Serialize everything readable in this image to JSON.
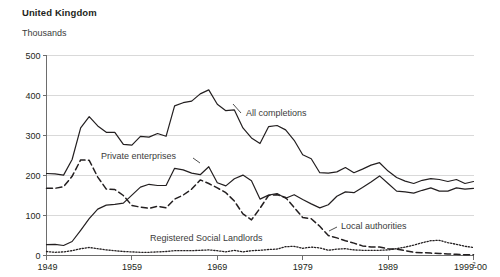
{
  "header": {
    "title": "United Kingdom",
    "unit_label": "Thousands"
  },
  "chart_data": {
    "type": "line",
    "title": "United Kingdom",
    "subtitle": "Thousands",
    "xlabel": "",
    "ylabel": "Thousands",
    "ylim": [
      0,
      500
    ],
    "yticks": [
      0,
      100,
      200,
      300,
      400,
      500
    ],
    "ytick_labels": [
      "0",
      "100",
      "200",
      "300",
      "400",
      "500"
    ],
    "xlim": [
      1949,
      1999
    ],
    "xticks": [
      1949,
      1959,
      1969,
      1979,
      1989,
      1999
    ],
    "xtick_labels": [
      "1949",
      "1959",
      "1969",
      "1979",
      "1989",
      "1999-00"
    ],
    "xtick_last_superscript": "2",
    "grid": "horizontal",
    "legend_position": "inline-annotations",
    "x": [
      1949,
      1950,
      1951,
      1952,
      1953,
      1954,
      1955,
      1956,
      1957,
      1958,
      1959,
      1960,
      1961,
      1962,
      1963,
      1964,
      1965,
      1966,
      1967,
      1968,
      1969,
      1970,
      1971,
      1972,
      1973,
      1974,
      1975,
      1976,
      1977,
      1978,
      1979,
      1980,
      1981,
      1982,
      1983,
      1984,
      1985,
      1986,
      1987,
      1988,
      1989,
      1990,
      1991,
      1992,
      1993,
      1994,
      1995,
      1996,
      1997,
      1998,
      1999
    ],
    "series": [
      {
        "name": "All completions",
        "label": "All completions",
        "style": "solid",
        "color": "#231f20",
        "values": [
          205,
          204,
          201,
          240,
          319,
          347,
          324,
          308,
          308,
          278,
          276,
          298,
          296,
          305,
          298,
          374,
          382,
          386,
          404,
          414,
          378,
          362,
          364,
          319,
          294,
          280,
          322,
          325,
          314,
          288,
          252,
          242,
          207,
          206,
          209,
          220,
          207,
          216,
          226,
          232,
          211,
          195,
          186,
          180,
          188,
          192,
          190,
          185,
          190,
          180,
          185
        ]
      },
      {
        "name": "Private enterprises",
        "label": "Private enterprises",
        "style": "solid",
        "color": "#231f20",
        "values": [
          27,
          28,
          25,
          35,
          63,
          92,
          116,
          126,
          128,
          131,
          151,
          171,
          178,
          175,
          175,
          218,
          214,
          206,
          202,
          222,
          182,
          174,
          192,
          201,
          187,
          141,
          151,
          155,
          143,
          152,
          140,
          129,
          119,
          127,
          148,
          159,
          157,
          170,
          184,
          199,
          180,
          161,
          159,
          156,
          163,
          169,
          161,
          161,
          169,
          166,
          168
        ]
      },
      {
        "name": "Local authorities",
        "label": "Local authorities",
        "style": "dashed",
        "color": "#231f20",
        "values": [
          168,
          168,
          172,
          198,
          239,
          238,
          196,
          166,
          165,
          150,
          125,
          121,
          118,
          123,
          119,
          141,
          151,
          166,
          189,
          180,
          169,
          157,
          136,
          104,
          89,
          118,
          150,
          152,
          145,
          120,
          95,
          92,
          73,
          50,
          44,
          37,
          31,
          24,
          21,
          21,
          17,
          16,
          12,
          8,
          7,
          6,
          5,
          4,
          3,
          2,
          2
        ]
      },
      {
        "name": "Registered Social Landlords",
        "label": "Registered Social Landlords",
        "style": "dotted",
        "color": "#231f20",
        "values": [
          10,
          8,
          9,
          12,
          17,
          20,
          17,
          14,
          12,
          10,
          9,
          8,
          8,
          9,
          10,
          12,
          12,
          12,
          13,
          14,
          12,
          9,
          13,
          9,
          12,
          13,
          15,
          16,
          22,
          23,
          18,
          21,
          19,
          13,
          16,
          17,
          14,
          13,
          13,
          13,
          14,
          17,
          21,
          26,
          32,
          37,
          38,
          32,
          28,
          23,
          20
        ]
      }
    ],
    "annotations": [
      {
        "text": "All completions",
        "series": "All completions"
      },
      {
        "text": "Private enterprises",
        "series": "Private enterprises"
      },
      {
        "text": "Local authorities",
        "series": "Local authorities"
      },
      {
        "text": "Registered Social Landlords",
        "series": "Registered Social Landlords"
      }
    ]
  }
}
